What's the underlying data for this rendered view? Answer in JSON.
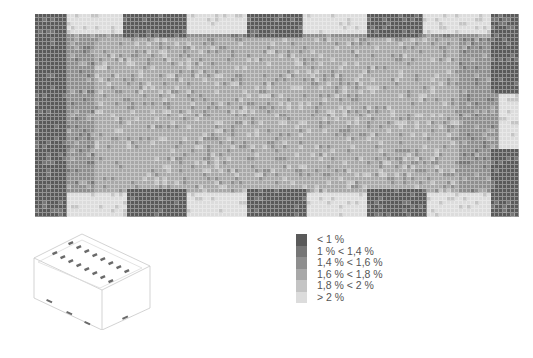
{
  "chart_data": {
    "type": "heatmap",
    "title": "",
    "grid": {
      "cols": 121,
      "rows": 51,
      "cell_px": 4
    },
    "levels": [
      {
        "label": "< 1 %",
        "color": "#5a5a5a"
      },
      {
        "label": "1 % < 1,4 %",
        "color": "#767676"
      },
      {
        "label": "1,4 % < 1,6 %",
        "color": "#8e8e8e"
      },
      {
        "label": "1,6 % < 1,8 %",
        "color": "#a8a8a8"
      },
      {
        "label": "1,8 % < 2 %",
        "color": "#c4c4c4"
      },
      {
        "label": "> 2 %",
        "color": "#dcdcdc"
      }
    ],
    "zones": [
      {
        "note": "left wall dark band",
        "x": [
          0,
          0.07
        ],
        "y": [
          0,
          1
        ],
        "level": 0
      },
      {
        "note": "top window 1 bright",
        "x": [
          0.07,
          0.18
        ],
        "y": [
          0,
          0.1
        ],
        "level": 5
      },
      {
        "note": "top dark 1",
        "x": [
          0.18,
          0.31
        ],
        "y": [
          0,
          0.12
        ],
        "level": 0
      },
      {
        "note": "top window 2 bright",
        "x": [
          0.31,
          0.44
        ],
        "y": [
          0,
          0.1
        ],
        "level": 5
      },
      {
        "note": "top dark 2",
        "x": [
          0.44,
          0.55
        ],
        "y": [
          0,
          0.12
        ],
        "level": 0
      },
      {
        "note": "top window 3 bright",
        "x": [
          0.55,
          0.69
        ],
        "y": [
          0,
          0.1
        ],
        "level": 5
      },
      {
        "note": "top dark 3",
        "x": [
          0.69,
          0.8
        ],
        "y": [
          0,
          0.12
        ],
        "level": 0
      },
      {
        "note": "top window 4 bright",
        "x": [
          0.8,
          0.94
        ],
        "y": [
          0,
          0.1
        ],
        "level": 5
      },
      {
        "note": "right top dark",
        "x": [
          0.94,
          1
        ],
        "y": [
          0,
          0.4
        ],
        "level": 0
      },
      {
        "note": "right mid bright",
        "x": [
          0.96,
          1
        ],
        "y": [
          0.4,
          0.67
        ],
        "level": 5
      },
      {
        "note": "right bottom dark",
        "x": [
          0.94,
          1
        ],
        "y": [
          0.67,
          1
        ],
        "level": 0
      },
      {
        "note": "bottom window 1 bright",
        "x": [
          0.07,
          0.19
        ],
        "y": [
          0.88,
          1
        ],
        "level": 5
      },
      {
        "note": "bottom dark 1",
        "x": [
          0.19,
          0.31
        ],
        "y": [
          0.86,
          1
        ],
        "level": 0
      },
      {
        "note": "bottom window 2 bright",
        "x": [
          0.31,
          0.44
        ],
        "y": [
          0.88,
          1
        ],
        "level": 5
      },
      {
        "note": "bottom dark 2",
        "x": [
          0.44,
          0.56
        ],
        "y": [
          0.86,
          1
        ],
        "level": 0
      },
      {
        "note": "bottom window 3 bright",
        "x": [
          0.56,
          0.69
        ],
        "y": [
          0.88,
          1
        ],
        "level": 5
      },
      {
        "note": "bottom dark 3",
        "x": [
          0.69,
          0.81
        ],
        "y": [
          0.86,
          1
        ],
        "level": 0
      },
      {
        "note": "bottom window 4 bright",
        "x": [
          0.81,
          0.94
        ],
        "y": [
          0.88,
          1
        ],
        "level": 5
      }
    ],
    "interior_level": 3,
    "xlabel": "",
    "ylabel": "",
    "legend_position": "bottom-center"
  },
  "legend": {
    "items": [
      {
        "label": "< 1 %"
      },
      {
        "label": "1 % < 1,4 %"
      },
      {
        "label": "1,4 % < 1,6 %"
      },
      {
        "label": "1,6 % < 1,8 %"
      },
      {
        "label": "1,8 % < 2 %"
      },
      {
        "label": "> 2 %"
      }
    ]
  },
  "building_icon": {
    "name": "isometric-building-with-skylights"
  }
}
